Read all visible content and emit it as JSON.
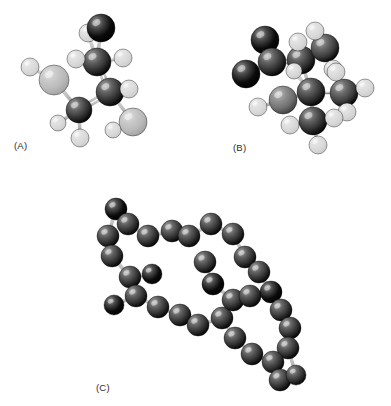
{
  "figure": {
    "background_color": "#ffffff",
    "width": 391,
    "height": 406,
    "label_color": "#2b2b2b"
  },
  "atom_palette": {
    "black": "#0b0b0b",
    "dark_gray": "#2f2f2f",
    "mid_dark_gray": "#3d3d3d",
    "medium_gray": "#6f6f6f",
    "light_gray": "#b9b9b9",
    "white_gray": "#d8d8d8",
    "bond": "#c2c2c2",
    "bond_dark": "#8a8a8a",
    "outline": "#000000"
  },
  "panels": [
    {
      "id": "A",
      "label": "(A)",
      "label_x": 14,
      "label_y": 140,
      "origin_x": 0,
      "origin_y": 0,
      "bonds": [
        {
          "x1": 101,
          "y1": 28,
          "x2": 97,
          "y2": 62,
          "style": "single"
        },
        {
          "x1": 97,
          "y1": 62,
          "x2": 88,
          "y2": 33,
          "style": "single"
        },
        {
          "x1": 97,
          "y1": 62,
          "x2": 123,
          "y2": 58,
          "style": "single"
        },
        {
          "x1": 97,
          "y1": 62,
          "x2": 76,
          "y2": 59,
          "style": "single"
        },
        {
          "x1": 97,
          "y1": 62,
          "x2": 110,
          "y2": 92,
          "style": "double"
        },
        {
          "x1": 110,
          "y1": 92,
          "x2": 129,
          "y2": 89,
          "style": "single"
        },
        {
          "x1": 110,
          "y1": 92,
          "x2": 133,
          "y2": 122,
          "style": "single"
        },
        {
          "x1": 110,
          "y1": 92,
          "x2": 79,
          "y2": 110,
          "style": "double"
        },
        {
          "x1": 79,
          "y1": 110,
          "x2": 58,
          "y2": 123,
          "style": "single"
        },
        {
          "x1": 79,
          "y1": 110,
          "x2": 80,
          "y2": 138,
          "style": "single"
        },
        {
          "x1": 79,
          "y1": 110,
          "x2": 54,
          "y2": 80,
          "style": "single"
        },
        {
          "x1": 54,
          "y1": 80,
          "x2": 30,
          "y2": 67,
          "style": "single"
        },
        {
          "x1": 133,
          "y1": 122,
          "x2": 113,
          "y2": 130,
          "style": "single"
        }
      ],
      "atoms": [
        {
          "cx": 54,
          "cy": 80,
          "r": 15,
          "tone": "light_gray"
        },
        {
          "cx": 30,
          "cy": 67,
          "r": 9,
          "tone": "white_gray"
        },
        {
          "cx": 79,
          "cy": 110,
          "r": 13,
          "tone": "dark_gray"
        },
        {
          "cx": 58,
          "cy": 123,
          "r": 8,
          "tone": "white_gray"
        },
        {
          "cx": 80,
          "cy": 138,
          "r": 9,
          "tone": "white_gray"
        },
        {
          "cx": 110,
          "cy": 92,
          "r": 14,
          "tone": "dark_gray"
        },
        {
          "cx": 129,
          "cy": 89,
          "r": 9,
          "tone": "white_gray"
        },
        {
          "cx": 133,
          "cy": 122,
          "r": 14,
          "tone": "light_gray"
        },
        {
          "cx": 113,
          "cy": 130,
          "r": 8,
          "tone": "white_gray"
        },
        {
          "cx": 97,
          "cy": 62,
          "r": 14,
          "tone": "dark_gray"
        },
        {
          "cx": 76,
          "cy": 59,
          "r": 9,
          "tone": "white_gray"
        },
        {
          "cx": 123,
          "cy": 58,
          "r": 9,
          "tone": "white_gray"
        },
        {
          "cx": 88,
          "cy": 33,
          "r": 9,
          "tone": "white_gray"
        },
        {
          "cx": 101,
          "cy": 28,
          "r": 14,
          "tone": "black"
        }
      ]
    },
    {
      "id": "B",
      "label": "(B)",
      "label_x": 233,
      "label_y": 142,
      "origin_x": 0,
      "origin_y": 0,
      "bonds": [
        {
          "x1": 265,
          "y1": 40,
          "x2": 272,
          "y2": 62,
          "style": "single"
        },
        {
          "x1": 272,
          "y1": 62,
          "x2": 246,
          "y2": 74,
          "style": "single"
        },
        {
          "x1": 272,
          "y1": 62,
          "x2": 301,
          "y2": 60,
          "style": "double"
        },
        {
          "x1": 301,
          "y1": 60,
          "x2": 298,
          "y2": 42,
          "style": "single"
        },
        {
          "x1": 301,
          "y1": 60,
          "x2": 325,
          "y2": 48,
          "style": "single"
        },
        {
          "x1": 325,
          "y1": 48,
          "x2": 315,
          "y2": 31,
          "style": "single"
        },
        {
          "x1": 325,
          "y1": 48,
          "x2": 333,
          "y2": 69,
          "style": "single"
        },
        {
          "x1": 301,
          "y1": 60,
          "x2": 311,
          "y2": 92,
          "style": "single"
        },
        {
          "x1": 311,
          "y1": 92,
          "x2": 294,
          "y2": 71,
          "style": "single"
        },
        {
          "x1": 311,
          "y1": 92,
          "x2": 344,
          "y2": 93,
          "style": "single"
        },
        {
          "x1": 344,
          "y1": 93,
          "x2": 365,
          "y2": 88,
          "style": "single"
        },
        {
          "x1": 344,
          "y1": 93,
          "x2": 347,
          "y2": 112,
          "style": "single"
        },
        {
          "x1": 344,
          "y1": 93,
          "x2": 336,
          "y2": 72,
          "style": "single"
        },
        {
          "x1": 311,
          "y1": 92,
          "x2": 283,
          "y2": 100,
          "style": "single"
        },
        {
          "x1": 283,
          "y1": 100,
          "x2": 258,
          "y2": 107,
          "style": "single"
        },
        {
          "x1": 311,
          "y1": 92,
          "x2": 313,
          "y2": 121,
          "style": "single"
        },
        {
          "x1": 313,
          "y1": 121,
          "x2": 290,
          "y2": 125,
          "style": "single"
        },
        {
          "x1": 313,
          "y1": 121,
          "x2": 334,
          "y2": 118,
          "style": "single"
        },
        {
          "x1": 313,
          "y1": 121,
          "x2": 318,
          "y2": 145,
          "style": "single"
        }
      ],
      "atoms": [
        {
          "cx": 265,
          "cy": 40,
          "r": 14,
          "tone": "black"
        },
        {
          "cx": 246,
          "cy": 74,
          "r": 14,
          "tone": "black"
        },
        {
          "cx": 272,
          "cy": 62,
          "r": 14,
          "tone": "dark_gray"
        },
        {
          "cx": 301,
          "cy": 60,
          "r": 14,
          "tone": "dark_gray"
        },
        {
          "cx": 298,
          "cy": 42,
          "r": 9,
          "tone": "white_gray"
        },
        {
          "cx": 325,
          "cy": 48,
          "r": 14,
          "tone": "mid_dark_gray"
        },
        {
          "cx": 315,
          "cy": 31,
          "r": 9,
          "tone": "white_gray"
        },
        {
          "cx": 333,
          "cy": 69,
          "r": 9,
          "tone": "white_gray"
        },
        {
          "cx": 311,
          "cy": 92,
          "r": 14,
          "tone": "dark_gray"
        },
        {
          "cx": 294,
          "cy": 71,
          "r": 8,
          "tone": "white_gray"
        },
        {
          "cx": 344,
          "cy": 93,
          "r": 14,
          "tone": "mid_dark_gray"
        },
        {
          "cx": 365,
          "cy": 88,
          "r": 9,
          "tone": "white_gray"
        },
        {
          "cx": 347,
          "cy": 112,
          "r": 9,
          "tone": "white_gray"
        },
        {
          "cx": 336,
          "cy": 72,
          "r": 9,
          "tone": "white_gray"
        },
        {
          "cx": 283,
          "cy": 100,
          "r": 14,
          "tone": "medium_gray"
        },
        {
          "cx": 258,
          "cy": 107,
          "r": 9,
          "tone": "white_gray"
        },
        {
          "cx": 313,
          "cy": 121,
          "r": 14,
          "tone": "dark_gray"
        },
        {
          "cx": 290,
          "cy": 125,
          "r": 9,
          "tone": "white_gray"
        },
        {
          "cx": 334,
          "cy": 118,
          "r": 9,
          "tone": "white_gray"
        },
        {
          "cx": 318,
          "cy": 145,
          "r": 9,
          "tone": "white_gray"
        }
      ]
    },
    {
      "id": "C",
      "label": "(C)",
      "label_x": 96,
      "label_y": 382,
      "origin_x": 0,
      "origin_y": 0,
      "bonds": [
        {
          "x1": 116,
          "y1": 209,
          "x2": 128,
          "y2": 224,
          "style": "single"
        },
        {
          "x1": 128,
          "y1": 224,
          "x2": 148,
          "y2": 236,
          "style": "single"
        },
        {
          "x1": 148,
          "y1": 236,
          "x2": 172,
          "y2": 231,
          "style": "single"
        },
        {
          "x1": 172,
          "y1": 231,
          "x2": 189,
          "y2": 236,
          "style": "single"
        },
        {
          "x1": 189,
          "y1": 236,
          "x2": 211,
          "y2": 224,
          "style": "single"
        },
        {
          "x1": 211,
          "y1": 224,
          "x2": 233,
          "y2": 234,
          "style": "single"
        },
        {
          "x1": 233,
          "y1": 234,
          "x2": 245,
          "y2": 257,
          "style": "single"
        },
        {
          "x1": 245,
          "y1": 257,
          "x2": 259,
          "y2": 272,
          "style": "single"
        },
        {
          "x1": 259,
          "y1": 272,
          "x2": 271,
          "y2": 292,
          "style": "single"
        },
        {
          "x1": 271,
          "y1": 292,
          "x2": 281,
          "y2": 310,
          "style": "single"
        },
        {
          "x1": 281,
          "y1": 310,
          "x2": 290,
          "y2": 328,
          "style": "single"
        },
        {
          "x1": 290,
          "y1": 328,
          "x2": 288,
          "y2": 348,
          "style": "single"
        },
        {
          "x1": 288,
          "y1": 348,
          "x2": 273,
          "y2": 362,
          "style": "single"
        },
        {
          "x1": 273,
          "y1": 362,
          "x2": 280,
          "y2": 380,
          "style": "single"
        },
        {
          "x1": 280,
          "y1": 380,
          "x2": 296,
          "y2": 375,
          "style": "single"
        },
        {
          "x1": 296,
          "y1": 375,
          "x2": 288,
          "y2": 348,
          "style": "single"
        },
        {
          "x1": 116,
          "y1": 209,
          "x2": 108,
          "y2": 236,
          "style": "single"
        },
        {
          "x1": 108,
          "y1": 236,
          "x2": 112,
          "y2": 256,
          "style": "single"
        },
        {
          "x1": 112,
          "y1": 256,
          "x2": 130,
          "y2": 277,
          "style": "single"
        },
        {
          "x1": 130,
          "y1": 277,
          "x2": 152,
          "y2": 274,
          "style": "single"
        },
        {
          "x1": 130,
          "y1": 277,
          "x2": 136,
          "y2": 296,
          "style": "single"
        },
        {
          "x1": 136,
          "y1": 296,
          "x2": 114,
          "y2": 305,
          "style": "single"
        },
        {
          "x1": 136,
          "y1": 296,
          "x2": 158,
          "y2": 307,
          "style": "single"
        },
        {
          "x1": 158,
          "y1": 307,
          "x2": 180,
          "y2": 315,
          "style": "single"
        },
        {
          "x1": 180,
          "y1": 315,
          "x2": 198,
          "y2": 325,
          "style": "single"
        },
        {
          "x1": 198,
          "y1": 325,
          "x2": 222,
          "y2": 318,
          "style": "single"
        },
        {
          "x1": 222,
          "y1": 318,
          "x2": 233,
          "y2": 300,
          "style": "single"
        },
        {
          "x1": 233,
          "y1": 300,
          "x2": 213,
          "y2": 284,
          "style": "single"
        },
        {
          "x1": 213,
          "y1": 284,
          "x2": 205,
          "y2": 262,
          "style": "single"
        },
        {
          "x1": 233,
          "y1": 300,
          "x2": 250,
          "y2": 296,
          "style": "single"
        },
        {
          "x1": 250,
          "y1": 296,
          "x2": 271,
          "y2": 292,
          "style": "single"
        },
        {
          "x1": 222,
          "y1": 318,
          "x2": 235,
          "y2": 338,
          "style": "single"
        },
        {
          "x1": 235,
          "y1": 338,
          "x2": 252,
          "y2": 354,
          "style": "single"
        },
        {
          "x1": 252,
          "y1": 354,
          "x2": 273,
          "y2": 362,
          "style": "single"
        }
      ],
      "atoms": [
        {
          "cx": 116,
          "cy": 209,
          "r": 11,
          "tone": "black"
        },
        {
          "cx": 128,
          "cy": 224,
          "r": 11,
          "tone": "dark_gray"
        },
        {
          "cx": 148,
          "cy": 236,
          "r": 11,
          "tone": "dark_gray"
        },
        {
          "cx": 172,
          "cy": 231,
          "r": 11,
          "tone": "dark_gray"
        },
        {
          "cx": 189,
          "cy": 236,
          "r": 11,
          "tone": "dark_gray"
        },
        {
          "cx": 211,
          "cy": 224,
          "r": 11,
          "tone": "dark_gray"
        },
        {
          "cx": 233,
          "cy": 234,
          "r": 11,
          "tone": "dark_gray"
        },
        {
          "cx": 245,
          "cy": 257,
          "r": 11,
          "tone": "dark_gray"
        },
        {
          "cx": 259,
          "cy": 272,
          "r": 11,
          "tone": "dark_gray"
        },
        {
          "cx": 271,
          "cy": 292,
          "r": 11,
          "tone": "black"
        },
        {
          "cx": 281,
          "cy": 310,
          "r": 11,
          "tone": "dark_gray"
        },
        {
          "cx": 290,
          "cy": 328,
          "r": 11,
          "tone": "dark_gray"
        },
        {
          "cx": 288,
          "cy": 348,
          "r": 11,
          "tone": "dark_gray"
        },
        {
          "cx": 273,
          "cy": 362,
          "r": 11,
          "tone": "dark_gray"
        },
        {
          "cx": 280,
          "cy": 380,
          "r": 11,
          "tone": "dark_gray"
        },
        {
          "cx": 296,
          "cy": 375,
          "r": 10,
          "tone": "dark_gray"
        },
        {
          "cx": 108,
          "cy": 236,
          "r": 11,
          "tone": "dark_gray"
        },
        {
          "cx": 112,
          "cy": 256,
          "r": 11,
          "tone": "dark_gray"
        },
        {
          "cx": 130,
          "cy": 277,
          "r": 11,
          "tone": "dark_gray"
        },
        {
          "cx": 152,
          "cy": 274,
          "r": 10,
          "tone": "black"
        },
        {
          "cx": 136,
          "cy": 296,
          "r": 11,
          "tone": "dark_gray"
        },
        {
          "cx": 114,
          "cy": 305,
          "r": 10,
          "tone": "black"
        },
        {
          "cx": 158,
          "cy": 307,
          "r": 11,
          "tone": "dark_gray"
        },
        {
          "cx": 180,
          "cy": 315,
          "r": 11,
          "tone": "dark_gray"
        },
        {
          "cx": 198,
          "cy": 325,
          "r": 11,
          "tone": "dark_gray"
        },
        {
          "cx": 222,
          "cy": 318,
          "r": 11,
          "tone": "dark_gray"
        },
        {
          "cx": 233,
          "cy": 300,
          "r": 11,
          "tone": "dark_gray"
        },
        {
          "cx": 213,
          "cy": 284,
          "r": 11,
          "tone": "black"
        },
        {
          "cx": 205,
          "cy": 262,
          "r": 11,
          "tone": "dark_gray"
        },
        {
          "cx": 250,
          "cy": 296,
          "r": 11,
          "tone": "dark_gray"
        },
        {
          "cx": 235,
          "cy": 338,
          "r": 11,
          "tone": "dark_gray"
        },
        {
          "cx": 252,
          "cy": 354,
          "r": 11,
          "tone": "dark_gray"
        }
      ]
    }
  ]
}
